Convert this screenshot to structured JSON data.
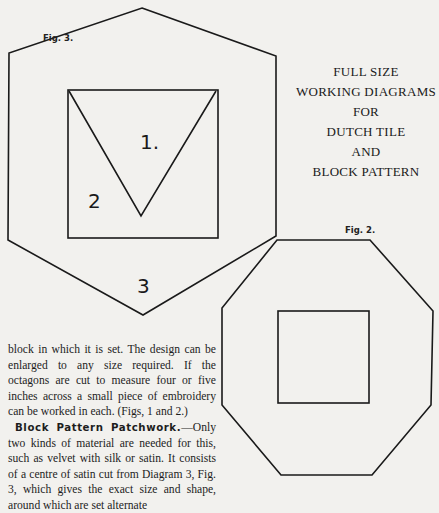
{
  "figures": {
    "fig3": {
      "label": "Fig. 3.",
      "pieces": [
        "1.",
        "2",
        "3"
      ],
      "outer_shape": "hexagon",
      "inner_shape": "square with inverted triangle"
    },
    "fig2": {
      "label": "Fig. 2.",
      "outer_shape": "octagon",
      "inner_shape": "square"
    }
  },
  "title": {
    "lines": [
      "FULL SIZE",
      "WORKING DIAGRAMS",
      "FOR",
      "DUTCH TILE",
      "AND",
      "BLOCK PATTERN"
    ]
  },
  "body": {
    "para1": "block in which it is set.  The design can be enlarged to any size required.  If the octagons are cut to measure four or five inches across a small piece of embroidery can be worked in each.  (Figs, 1 and 2.)",
    "para2_heading": "Block Pattern Patchwork.",
    "para2_text": "—Only two kinds of material are needed for this, such as velvet with silk or satin.  It consists of a centre of satin cut from Diagram 3, Fig. 3, which gives the exact size and shape, around which are set alternate"
  },
  "colors": {
    "paper": "#f2f1ee",
    "ink": "#1d1d1d"
  }
}
